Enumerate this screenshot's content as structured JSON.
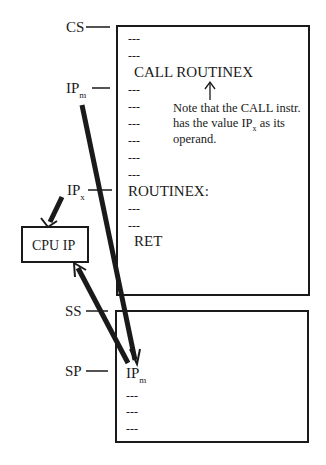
{
  "registers": {
    "cs": "CS",
    "ipm_main": "IP",
    "ipm_sub": "m",
    "ipx_main": "IP",
    "ipx_sub": "x",
    "ss": "SS",
    "sp": "SP"
  },
  "cpu_box": {
    "label": "CPU IP"
  },
  "code_segment": {
    "dash": "---",
    "call_instruction": "CALL ROUTINEX",
    "routine_label": "ROUTINEX:",
    "ret_instruction": "RET",
    "note": {
      "line1": "Note that the CALL instr.",
      "line2_pre": "has the value IP",
      "line2_sub": "x",
      "line2_post": " as its",
      "line3": "operand."
    }
  },
  "stack_segment": {
    "top_main": "IP",
    "top_sub": "m",
    "dash": "---"
  },
  "colors": {
    "ink": "#1a1a1a",
    "background": "#ffffff"
  }
}
